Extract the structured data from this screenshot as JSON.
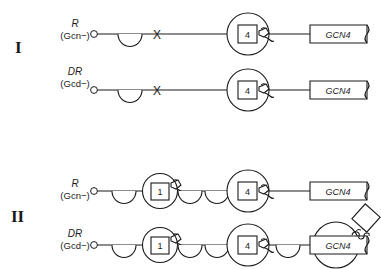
{
  "figure": {
    "type": "biological-regulatory-diagram",
    "background_color": "#ffffff",
    "stroke_color": "#1a1a1a",
    "fill_color": "#ffffff"
  },
  "panels": [
    {
      "id": "I",
      "numeral": "I",
      "rows": [
        {
          "id": "I-R",
          "label": "R",
          "sublabel": "(Gcn−)",
          "blocked": true,
          "block_symbol": "X",
          "nodes": [
            {
              "kind": "start-dot",
              "label": ""
            },
            {
              "kind": "semicircle",
              "label": "",
              "hatched": false
            },
            {
              "kind": "block-x",
              "label": "X"
            },
            {
              "kind": "circle-box",
              "label": "4",
              "hatched": false,
              "has_squiggle": true
            }
          ],
          "gene": {
            "label": "GCN4",
            "transcript": false,
            "hatched_circle": false
          },
          "product": {
            "present": false,
            "label": ""
          }
        },
        {
          "id": "I-DR",
          "label": "DR",
          "sublabel": "(Gcd−)",
          "blocked": true,
          "block_symbol": "X",
          "nodes": [
            {
              "kind": "start-dot",
              "label": ""
            },
            {
              "kind": "semicircle",
              "label": "",
              "hatched": false
            },
            {
              "kind": "block-x",
              "label": "X"
            },
            {
              "kind": "circle-box",
              "label": "4",
              "hatched": false,
              "has_squiggle": true
            }
          ],
          "gene": {
            "label": "GCN4",
            "transcript": false,
            "hatched_circle": false
          },
          "product": {
            "present": false,
            "label": ""
          }
        }
      ]
    },
    {
      "id": "II",
      "numeral": "II",
      "rows": [
        {
          "id": "II-R",
          "label": "R",
          "sublabel": "(Gcn−)",
          "blocked": false,
          "block_symbol": "",
          "nodes": [
            {
              "kind": "start-dot",
              "label": ""
            },
            {
              "kind": "semicircle",
              "label": "",
              "hatched": false
            },
            {
              "kind": "circle-box",
              "label": "1",
              "hatched": false,
              "has_squiggle": true
            },
            {
              "kind": "semicircle",
              "label": "",
              "hatched": false
            },
            {
              "kind": "semicircle",
              "label": "",
              "hatched": false
            },
            {
              "kind": "circle-box",
              "label": "4",
              "hatched": false,
              "has_squiggle": true
            }
          ],
          "gene": {
            "label": "GCN4",
            "transcript": false,
            "hatched_circle": false
          },
          "product": {
            "present": false,
            "label": ""
          }
        },
        {
          "id": "II-DR",
          "label": "DR",
          "sublabel": "(Gcd−)",
          "blocked": false,
          "block_symbol": "",
          "nodes": [
            {
              "kind": "start-dot",
              "label": ""
            },
            {
              "kind": "semicircle",
              "label": "",
              "hatched": false
            },
            {
              "kind": "circle-box",
              "label": "1",
              "hatched": false,
              "has_squiggle": true
            },
            {
              "kind": "semicircle",
              "label": "",
              "hatched": true
            },
            {
              "kind": "semicircle",
              "label": "",
              "hatched": true
            },
            {
              "kind": "circle-box",
              "label": "4",
              "hatched": true,
              "has_squiggle": true
            },
            {
              "kind": "semicircle",
              "label": "",
              "hatched": true
            }
          ],
          "gene": {
            "label": "GCN4",
            "transcript": true,
            "hatched_circle": true
          },
          "product": {
            "present": true,
            "label": ""
          }
        }
      ]
    }
  ]
}
